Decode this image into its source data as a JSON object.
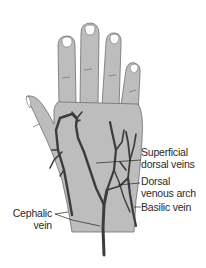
{
  "figure": {
    "colors": {
      "skin": "#bdbdbd",
      "outline": "#6e6e6e",
      "vein": "#3c3c3c",
      "nail": "#ffffff",
      "leader": "#222222",
      "text": "#2a2a2a"
    }
  },
  "labels": {
    "superficial": {
      "line1": "Superficial",
      "line2": "dorsal veins"
    },
    "arch": {
      "line1": "Dorsal",
      "line2": "venous arch"
    },
    "basilic": {
      "line1": "Basilic vein"
    },
    "cephalic": {
      "line1": "Cephalic",
      "line2": "vein"
    }
  }
}
